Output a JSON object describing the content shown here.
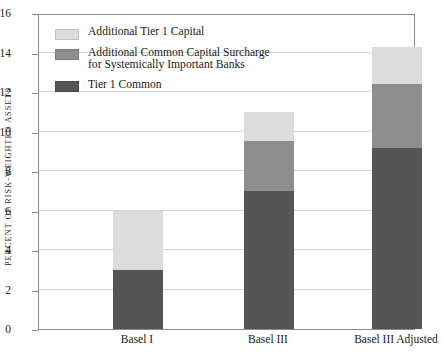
{
  "chart_data": {
    "type": "bar",
    "stacked": true,
    "title": "",
    "subtitle": "",
    "xlabel": "",
    "ylabel": "PERCENT OF RISK-WEIGHTED ASSETS",
    "categories": [
      "Basel I",
      "Basel III",
      "Basel III Adjusted"
    ],
    "series": [
      {
        "name": "Tier 1 Common",
        "color": "#555555",
        "values": [
          3.0,
          7.0,
          9.15
        ]
      },
      {
        "name": "Additional Common Capital Surcharge\nfor Systemically Important Banks",
        "color": "#8e8e8e",
        "values": [
          0.0,
          2.5,
          3.25
        ]
      },
      {
        "name": "Additional Tier 1 Capital",
        "color": "#dcdcdc",
        "values": [
          3.0,
          1.5,
          1.9
        ]
      }
    ],
    "totals": [
      6.0,
      11.0,
      14.3
    ],
    "ylim": [
      0,
      16
    ],
    "yticks": [
      0,
      2,
      4,
      6,
      8,
      10,
      12,
      14,
      16
    ],
    "ytick_labels": [
      "0",
      "2",
      "4",
      "6",
      "8",
      "10",
      "12",
      "14",
      "16"
    ],
    "grid": true,
    "grid_axis": "y",
    "legend_position": "upper-left",
    "legend_order": [
      "Additional Tier 1 Capital",
      "Additional Common Capital Surcharge\nfor Systemically Important Banks",
      "Tier 1 Common"
    ]
  },
  "legend": {
    "items": [
      {
        "label": "Additional Tier 1 Capital",
        "color": "#dcdcdc"
      },
      {
        "label": "Additional Common Capital Surcharge\nfor Systemically Important Banks",
        "color": "#8e8e8e"
      },
      {
        "label": "Tier 1 Common",
        "color": "#555555"
      }
    ]
  },
  "axes": {
    "y_title": "PERCENT OF RISK-WEIGHTED ASSETS",
    "y_tick_labels": [
      "0",
      "2",
      "4",
      "6",
      "8",
      "10",
      "12",
      "14",
      "16"
    ],
    "x_tick_labels": [
      "Basel I",
      "Basel III",
      "Basel III Adjusted"
    ]
  },
  "colors": {
    "tier1_common": "#555555",
    "surcharge": "#8e8e8e",
    "additional_tier1": "#dcdcdc",
    "grid": "#d6d6d6",
    "frame": "#8a8a8a",
    "background": "#ffffff"
  }
}
